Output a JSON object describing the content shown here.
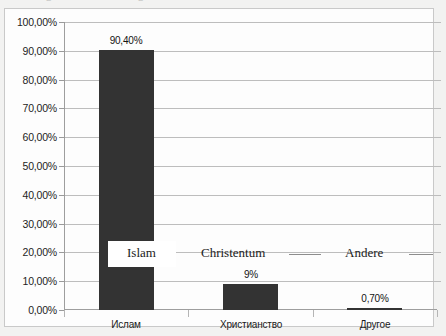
{
  "chart_data": {
    "type": "bar",
    "title": "",
    "xlabel": "",
    "ylabel": "",
    "categories": [
      "Ислам",
      "Христианство",
      "Другое"
    ],
    "values": [
      90.4,
      9.0,
      0.7
    ],
    "data_labels": [
      "90,40%",
      "9%",
      "0,70%"
    ],
    "ylim": [
      0,
      100
    ],
    "ytick_values": [
      0,
      10,
      20,
      30,
      40,
      50,
      60,
      70,
      80,
      90,
      100
    ],
    "ytick_labels": [
      "0,00%",
      "10,00%",
      "20,00%",
      "30,00%",
      "40,00%",
      "50,00%",
      "60,00%",
      "70,00%",
      "80,00%",
      "90,00%",
      "100,00%"
    ],
    "grid": true,
    "legend": "none",
    "bar_color": "#333333",
    "gridline_color": "#bdbdbd",
    "annotations": [
      {
        "text": "Islam",
        "language": "de"
      },
      {
        "text": "Christentum",
        "language": "de"
      },
      {
        "text": "Andere",
        "language": "de"
      }
    ]
  },
  "axis": {
    "y_labels": [
      "100,00%",
      "90,00%",
      "80,00%",
      "70,00%",
      "60,00%",
      "50,00%",
      "40,00%",
      "30,00%",
      "20,00%",
      "10,00%",
      "0,00%"
    ],
    "x_labels": [
      "Ислам",
      "Христианство",
      "Другое"
    ]
  },
  "bars": [
    {
      "label": "Ислам",
      "value_label": "90,40%"
    },
    {
      "label": "Христианство",
      "value_label": "9%"
    },
    {
      "label": "Другое",
      "value_label": "0,70%"
    }
  ],
  "annotations": {
    "islam": "Islam",
    "christentum": "Christentum",
    "andere": "Andere"
  },
  "top_cut_text": {
    "fragment_a": "g",
    "fragment_b": "g"
  }
}
